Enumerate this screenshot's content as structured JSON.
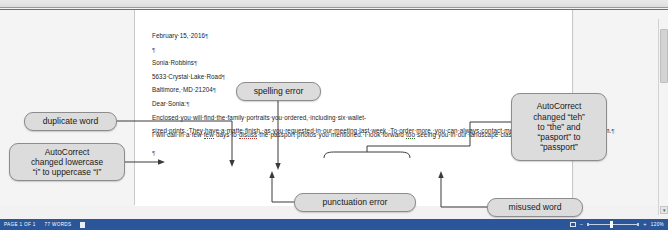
{
  "app": {
    "title": "Microsoft Word document view",
    "zoom_level": "120%"
  },
  "document": {
    "lines": [
      {
        "text": "February 15, 2016",
        "pilcrow": true
      },
      {
        "text": "",
        "pilcrow": true
      },
      {
        "text": "Sonia Robbins",
        "pilcrow": true
      },
      {
        "text": "5633 Crystal Lake Road",
        "pilcrow": true
      },
      {
        "text": "Baltimore, MD 21204",
        "pilcrow": true
      },
      {
        "text": "Dear Sonia:",
        "pilcrow": true
      }
    ],
    "paragraph_1": "Enclosed you will find the family portraits you ordered, including six wallet-sized prints. They have a matte finish, as you requested in our meeting last week. To order more, you can always contact me at sandyhillstudio@cengage.com.",
    "paragraph_2_parts": {
      "a": "I will call in a few ",
      "dup": "few",
      "b": " days to ",
      "misspelled": "disuss",
      "c": " the passport photos you mentioned. I look forward ",
      "misused": "too",
      "d": " seeing you in our landscape class next month."
    },
    "trailing_pilcrow": "¶",
    "pilcrow_symbol": "¶",
    "space_dot": "·"
  },
  "callouts": [
    {
      "id": "duplicate",
      "text": "duplicate word"
    },
    {
      "id": "spelling",
      "text": "spelling error"
    },
    {
      "id": "lower-i",
      "line1": "AutoCorrect",
      "line2": "changed lowercase",
      "line3": "“i” to uppercase “I”"
    },
    {
      "id": "autocorrect",
      "line1": "AutoCorrect",
      "line2": "changed “teh”",
      "line3": "to “the” and",
      "line4": "“pasport” to",
      "line5": "“passport”"
    },
    {
      "id": "punctuation",
      "text": "punctuation error"
    },
    {
      "id": "misused",
      "text": "misused word"
    }
  ],
  "status_bar": {
    "page_label": "PAGE 1 OF 1",
    "word_count": "77 WORDS",
    "proofing_label": "",
    "zoom_out_label": "−",
    "zoom_in_label": "+",
    "zoom_percent": "120%"
  },
  "colors": {
    "status_bar_bg": "#2b579a",
    "callout_bg": "#dcdcdc",
    "callout_border": "#8c8c8c",
    "page_bg": "#ffffff",
    "canvas_bg": "#f1f1f1",
    "pilcrow": "#2f6ea5"
  }
}
